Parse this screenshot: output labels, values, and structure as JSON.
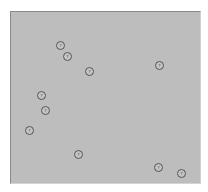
{
  "canvas": {
    "background": "#bdbdbd",
    "markers": [
      {
        "label": "?",
        "x": 61,
        "y": 46
      },
      {
        "label": "?",
        "x": 68,
        "y": 57
      },
      {
        "label": "?",
        "x": 90,
        "y": 72
      },
      {
        "label": "?",
        "x": 160,
        "y": 66
      },
      {
        "label": "?",
        "x": 42,
        "y": 96
      },
      {
        "label": "?",
        "x": 46,
        "y": 111
      },
      {
        "label": "?",
        "x": 30,
        "y": 131
      },
      {
        "label": "?",
        "x": 79,
        "y": 155
      },
      {
        "label": "?",
        "x": 159,
        "y": 168
      },
      {
        "label": "?",
        "x": 182,
        "y": 174
      }
    ]
  }
}
